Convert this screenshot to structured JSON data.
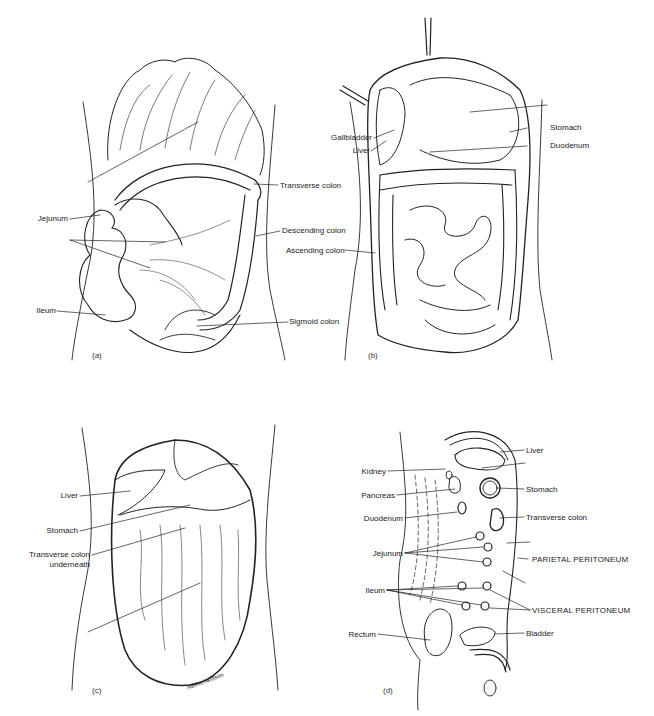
{
  "figure": {
    "panels": [
      {
        "id": "a",
        "tag": "(a)",
        "labels": [
          {
            "text": "Jejunum"
          },
          {
            "text": "Ileum"
          },
          {
            "text": "Transverse colon"
          },
          {
            "text": "Descending colon"
          },
          {
            "text": "Sigmoid colon"
          }
        ]
      },
      {
        "id": "b",
        "tag": "(b)",
        "labels": [
          {
            "text": "Gallbladder"
          },
          {
            "text": "Liver"
          },
          {
            "text": "Stomach"
          },
          {
            "text": "Duodenum"
          },
          {
            "text": "Ascending colon"
          }
        ]
      },
      {
        "id": "c",
        "tag": "(c)",
        "labels": [
          {
            "text": "Liver"
          },
          {
            "text": "Stomach"
          },
          {
            "text": "Transverse colon"
          },
          {
            "text": "underneath"
          }
        ],
        "signature": "NBRichardson"
      },
      {
        "id": "d",
        "tag": "(d)",
        "labels": [
          {
            "text": "Liver"
          },
          {
            "text": "Kidney"
          },
          {
            "text": "Pancreas"
          },
          {
            "text": "Stomach"
          },
          {
            "text": "Duodenum"
          },
          {
            "text": "Transverse colon"
          },
          {
            "text": "Jejunum"
          },
          {
            "text": "PARIETAL PERITONEUM"
          },
          {
            "text": "Ileum"
          },
          {
            "text": "VISCERAL PERITONEUM"
          },
          {
            "text": "Rectum"
          },
          {
            "text": "Bladder"
          }
        ]
      }
    ]
  }
}
